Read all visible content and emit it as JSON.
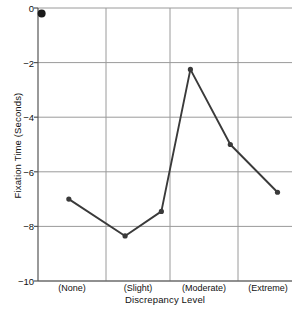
{
  "chart_data": {
    "type": "line",
    "title": "",
    "xlabel": "Discrepancy Level",
    "ylabel": "Fixation Time (Seconds)",
    "categories": [
      "(None)",
      "(Slight)",
      "(Moderate)",
      "(Extreme)"
    ],
    "xlim": [
      0,
      7
    ],
    "ylim": [
      -10,
      0
    ],
    "yticks": [
      0,
      -2,
      -4,
      -6,
      -8,
      -10
    ],
    "ytick_labels": [
      "0",
      "−2",
      "−4",
      "−6",
      "−8",
      "−10"
    ],
    "grid": true,
    "legend": "none",
    "series": [
      {
        "name": "fixation-time",
        "x": [
          0.85,
          2.4,
          3.4,
          4.2,
          5.3,
          6.6
        ],
        "values": [
          -7.0,
          -8.35,
          -7.45,
          -2.25,
          -5.0,
          -6.75
        ],
        "line_color": "#3a3a3a",
        "marker_color": "#3a3a3a"
      },
      {
        "name": "baseline-point",
        "x": [
          0.1
        ],
        "values": [
          -0.2
        ],
        "marker_color": "#1a1a1a",
        "line_color": "none"
      }
    ],
    "colors": {
      "line": "#3a3a3a",
      "marker": "#3a3a3a",
      "grid": "#9a9a9a",
      "axis": "#555555",
      "background": "#ffffff",
      "text": "#111111"
    }
  }
}
